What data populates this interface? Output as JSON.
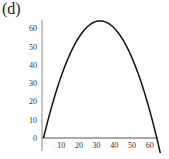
{
  "panel_label": "(d)",
  "chart_data": {
    "type": "line",
    "title": "",
    "xlabel": "",
    "ylabel": "",
    "xlim": [
      0,
      66
    ],
    "ylim": [
      0,
      66
    ],
    "x_ticks": [
      10,
      20,
      30,
      40,
      50,
      60
    ],
    "y_ticks": [
      0,
      10,
      20,
      30,
      40,
      50,
      60
    ],
    "grid": false,
    "legend": null,
    "series": [
      {
        "name": "curve",
        "description": "Downward parabola from (0,0) peaking at (32,64) returning to (64,0)",
        "x": [
          0,
          4,
          8,
          12,
          16,
          20,
          24,
          28,
          32,
          36,
          40,
          44,
          48,
          52,
          56,
          60,
          64,
          66
        ],
        "y": [
          0,
          15,
          28,
          39,
          48,
          55,
          60,
          63,
          64,
          63,
          60,
          55,
          48,
          39,
          28,
          15,
          0,
          -8.3
        ],
        "color": "#111111"
      }
    ]
  }
}
